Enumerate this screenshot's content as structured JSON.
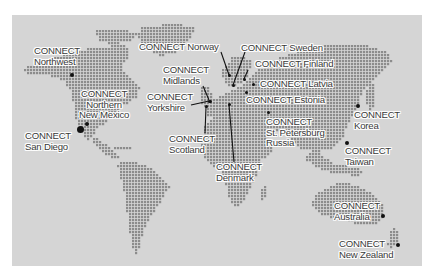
{
  "map": {
    "title": "",
    "colors": {
      "page_background": "#ffffff",
      "ocean": "#d5d5d5",
      "land_dot": "#8c8c8c",
      "marker": "#111111",
      "label_text": "#3a3a3a",
      "label_halo": "#ffffff"
    }
  },
  "locations": [
    {
      "id": "northwest",
      "line1": "CONNECT",
      "line2": "Northwest",
      "label_x": 34,
      "label_y": 46,
      "dot_x": 72,
      "dot_y": 75,
      "dot_size": 4
    },
    {
      "id": "northern-new-mexico",
      "line1": "CONNECT",
      "line2": "Northern",
      "line3": "New Mexico",
      "label_x": 79,
      "label_y": 89,
      "dot_x": 87,
      "dot_y": 124,
      "dot_size": 4
    },
    {
      "id": "san-diego",
      "line1": "CONNECT",
      "line2": "San Diego",
      "label_x": 25,
      "label_y": 131,
      "dot_x": 80,
      "dot_y": 129,
      "dot_size": 7
    },
    {
      "id": "norway",
      "line1": "CONNECT Norway",
      "label_x": 139,
      "label_y": 42,
      "dot_x": 229,
      "dot_y": 75,
      "dot_size": 3
    },
    {
      "id": "midlands",
      "line1": "CONNECT",
      "line2": "Midlands",
      "label_x": 163,
      "label_y": 65,
      "dot_x": 209,
      "dot_y": 101,
      "dot_size": 3
    },
    {
      "id": "yorkshire",
      "line1": "CONNECT",
      "line2": "Yorkshire",
      "label_x": 147,
      "label_y": 92,
      "dot_x": 210,
      "dot_y": 101,
      "dot_size": 3
    },
    {
      "id": "scotland",
      "line1": "CONNECT",
      "line2": "Scotland",
      "label_x": 169,
      "label_y": 134,
      "dot_x": 206,
      "dot_y": 106,
      "dot_size": 3
    },
    {
      "id": "denmark",
      "line1": "CONNECT",
      "line2": "Denmark",
      "label_x": 216,
      "label_y": 162,
      "dot_x": 229,
      "dot_y": 104,
      "dot_size": 3
    },
    {
      "id": "sweden",
      "line1": "CONNECT Sweden",
      "label_x": 241,
      "label_y": 43,
      "dot_x": 233,
      "dot_y": 85,
      "dot_size": 3
    },
    {
      "id": "finland",
      "line1": "CONNECT Finland",
      "label_x": 255,
      "label_y": 59,
      "dot_x": 244,
      "dot_y": 79,
      "dot_size": 3
    },
    {
      "id": "latvia",
      "line1": "CONNECT Latvia",
      "label_x": 260,
      "label_y": 79,
      "dot_x": 253,
      "dot_y": 84,
      "dot_size": 3
    },
    {
      "id": "estonia",
      "line1": "CONNECT Estonia",
      "label_x": 246,
      "label_y": 95,
      "dot_x": 246,
      "dot_y": 92,
      "dot_size": 3
    },
    {
      "id": "st-petersburg-russia",
      "line1": "CONNECT",
      "line2": "St. Petersburg",
      "line3": "Russia",
      "label_x": 266,
      "label_y": 117,
      "dot_x": 268,
      "dot_y": 112,
      "dot_size": 3
    },
    {
      "id": "korea",
      "line1": "CONNECT",
      "line2": "Korea",
      "label_x": 354,
      "label_y": 110,
      "dot_x": 358,
      "dot_y": 106,
      "dot_size": 4
    },
    {
      "id": "taiwan",
      "line1": "CONNECT",
      "line2": "Taiwan",
      "label_x": 345,
      "label_y": 146,
      "dot_x": 347,
      "dot_y": 143,
      "dot_size": 4
    },
    {
      "id": "australia",
      "line1": "CONNECT",
      "line2": "Australia",
      "label_x": 334,
      "label_y": 201,
      "dot_x": 383,
      "dot_y": 216,
      "dot_size": 4
    },
    {
      "id": "new-zealand",
      "line1": "CONNECT",
      "line2": "New Zealand",
      "label_x": 339,
      "label_y": 239,
      "dot_x": 398,
      "dot_y": 245,
      "dot_size": 4
    }
  ],
  "leader_lines": [
    {
      "from": "norway",
      "x1": 221,
      "y1": 52,
      "x2": 229,
      "y2": 75
    },
    {
      "from": "sweden",
      "x1": 245,
      "y1": 52,
      "x2": 233,
      "y2": 85
    },
    {
      "from": "finland",
      "x1": 248,
      "y1": 70,
      "x2": 244,
      "y2": 79
    },
    {
      "from": "midlands",
      "x1": 203,
      "y1": 86,
      "x2": 209,
      "y2": 100
    },
    {
      "from": "yorkshire",
      "x1": 191,
      "y1": 105,
      "x2": 209,
      "y2": 101
    },
    {
      "from": "scotland",
      "x1": 206,
      "y1": 107,
      "x2": 205,
      "y2": 133
    },
    {
      "from": "denmark",
      "x1": 229,
      "y1": 105,
      "x2": 234,
      "y2": 162
    }
  ]
}
